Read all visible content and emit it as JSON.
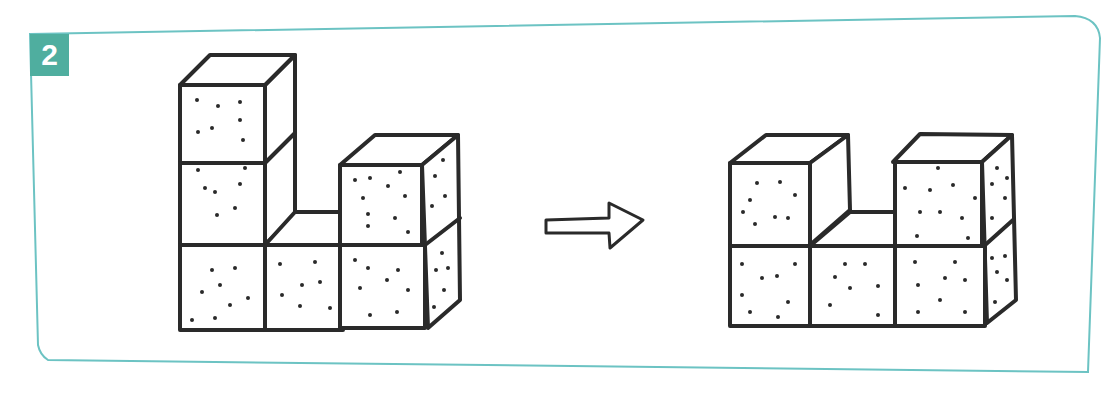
{
  "exercise": {
    "number": "2",
    "badge_color": "#4fae9f",
    "frame_color": "#6cc3c3"
  },
  "figures": [
    {
      "name": "before-structure",
      "description": "Six cubes: column of 3 on left, single cube bottom-middle, column of 2 on right"
    },
    {
      "name": "after-structure",
      "description": "Five cubes: column of 2 on left, single cube bottom-middle, column of 2 on right"
    }
  ],
  "arrow": {
    "direction": "right"
  }
}
